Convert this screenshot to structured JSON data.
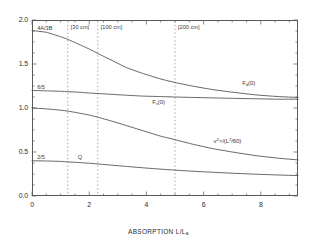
{
  "chart_data": {
    "type": "line",
    "title": "",
    "xlabel": "ABSORPTION L/L_a",
    "ylabel": "",
    "xlim": [
      0,
      9.3
    ],
    "ylim": [
      0.0,
      2.0
    ],
    "grid": false,
    "legend_position": "inline-labels",
    "x_ticks": [
      "0",
      "2",
      "4",
      "6",
      "8"
    ],
    "x_tick_values": [
      0,
      2,
      4,
      6,
      8
    ],
    "y_ticks": [
      "0.0",
      "0.5",
      "1.0",
      "1.5",
      "2.0"
    ],
    "y_tick_values": [
      0.0,
      0.5,
      1.0,
      1.5,
      2.0
    ],
    "series": [
      {
        "name": "F_d(0)",
        "label": "F",
        "label_sub": "d",
        "label_tail": "(0)",
        "axis_intercept_label": "4A/3B",
        "x": [
          0.0,
          0.5,
          1.0,
          1.25,
          1.6,
          2.0,
          2.3,
          2.8,
          3.3,
          3.9,
          4.5,
          5.0,
          5.6,
          6.3,
          7.0,
          7.8,
          8.6,
          9.3
        ],
        "values": [
          1.88,
          1.86,
          1.81,
          1.78,
          1.73,
          1.67,
          1.62,
          1.54,
          1.46,
          1.39,
          1.33,
          1.29,
          1.25,
          1.21,
          1.18,
          1.15,
          1.13,
          1.12
        ]
      },
      {
        "name": "F_v(0)",
        "label": "F",
        "label_sub": "v",
        "label_tail": "(0)",
        "axis_intercept_label": "6/5",
        "x": [
          0.0,
          0.5,
          1.0,
          1.25,
          1.6,
          2.0,
          2.3,
          2.8,
          3.3,
          3.9,
          4.5,
          5.0,
          5.6,
          6.3,
          7.0,
          7.8,
          8.6,
          9.3
        ],
        "values": [
          1.2,
          1.195,
          1.19,
          1.185,
          1.18,
          1.17,
          1.165,
          1.155,
          1.145,
          1.135,
          1.13,
          1.125,
          1.12,
          1.115,
          1.11,
          1.105,
          1.1,
          1.1
        ]
      },
      {
        "name": "<B_v^2>/(L^2/60)",
        "label": "<B",
        "label_sub": "v",
        "label_tail": "<sup>2</sup>>/(L<sup>2</sup>/60)",
        "axis_intercept_label": "",
        "x": [
          0.0,
          0.5,
          1.0,
          1.25,
          1.6,
          2.0,
          2.3,
          2.8,
          3.3,
          3.9,
          4.5,
          5.0,
          5.6,
          6.3,
          7.0,
          7.8,
          8.6,
          9.3
        ],
        "values": [
          1.0,
          0.99,
          0.975,
          0.965,
          0.945,
          0.92,
          0.895,
          0.85,
          0.8,
          0.74,
          0.68,
          0.64,
          0.59,
          0.54,
          0.5,
          0.46,
          0.43,
          0.41
        ]
      },
      {
        "name": "Q",
        "label": "Q",
        "label_sub": "",
        "label_tail": "",
        "axis_intercept_label": "2/5",
        "x": [
          0.0,
          0.5,
          1.0,
          1.25,
          1.6,
          2.0,
          2.3,
          2.8,
          3.3,
          3.9,
          4.5,
          5.0,
          5.6,
          6.3,
          7.0,
          7.8,
          8.6,
          9.3
        ],
        "values": [
          0.4,
          0.398,
          0.393,
          0.388,
          0.381,
          0.372,
          0.364,
          0.35,
          0.336,
          0.32,
          0.305,
          0.294,
          0.282,
          0.27,
          0.259,
          0.248,
          0.239,
          0.232
        ]
      }
    ],
    "vertical_markers": [
      {
        "x": 1.25,
        "label": "[30 cm]"
      },
      {
        "x": 2.3,
        "label": "[100 cm]"
      },
      {
        "x": 5.0,
        "label": "[200 cm]"
      }
    ],
    "annotations": [
      {
        "text": "4A/3B",
        "x": 0.18,
        "y": 1.9
      },
      {
        "text": "6/5",
        "x": 0.18,
        "y": 1.23
      },
      {
        "text": "2/5",
        "x": 0.18,
        "y": 0.43
      },
      {
        "text": "Q",
        "x": 1.6,
        "y": 0.43
      }
    ]
  },
  "axis": {
    "x_title_main": "ABSORPTION L/L",
    "x_title_sub": "a"
  }
}
